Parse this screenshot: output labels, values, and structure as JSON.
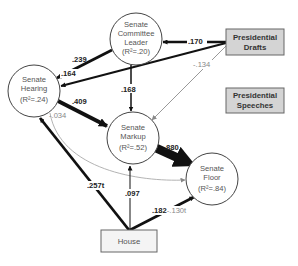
{
  "diagram": {
    "type": "path-model",
    "nodes": {
      "committee_leader": {
        "line1": "Senate",
        "line2": "Committee",
        "line3": "Leader",
        "r2": "(R²=.20)"
      },
      "hearing": {
        "line1": "Senate",
        "line2": "Hearing",
        "r2": "(R²=.24)"
      },
      "markup": {
        "line1": "Senate",
        "line2": "Markup",
        "r2": "(R²=.52)"
      },
      "floor": {
        "line1": "Senate",
        "line2": "Floor",
        "r2": "(R²=.84)"
      },
      "presidential_drafts": {
        "line1": "Presidential",
        "line2": "Drafts"
      },
      "presidential_speeches": {
        "line1": "Presidential",
        "line2": "Speeches"
      },
      "house": {
        "label": "House"
      }
    },
    "edges": [
      {
        "from": "Presidential Drafts",
        "to": "Senate Committee Leader",
        "label": ".170",
        "style": "thick"
      },
      {
        "from": "Presidential Drafts",
        "to": "Senate Hearing",
        "label": ".164",
        "style": "thick"
      },
      {
        "from": "Presidential Drafts",
        "to": "Senate Markup",
        "label": "-.134",
        "style": "thin-gray"
      },
      {
        "from": "Senate Committee Leader",
        "to": "Senate Hearing",
        "label": ".239",
        "style": "thick"
      },
      {
        "from": "Senate Committee Leader",
        "to": "Senate Markup",
        "label": ".168",
        "style": "medium"
      },
      {
        "from": "Senate Hearing",
        "to": "Senate Markup",
        "label": ".409",
        "style": "thicker"
      },
      {
        "from": "Senate Hearing",
        "to": "Senate Floor",
        "label": "-.034",
        "style": "thin-gray-curve"
      },
      {
        "from": "Senate Markup",
        "to": "Senate Floor",
        "label": ".880",
        "style": "thickest"
      },
      {
        "from": "House",
        "to": "Senate Hearing",
        "label": ".257t",
        "style": "thick"
      },
      {
        "from": "House",
        "to": "Senate Markup",
        "label": ".097",
        "style": "thin"
      },
      {
        "from": "House",
        "to": "Senate Floor",
        "label_main": ".182",
        "label_secondary": "-.130t",
        "style": "thick"
      }
    ],
    "colors": {
      "box_fill": "#d4d4d4",
      "box_border": "#666666",
      "edge_dark": "#111111",
      "edge_gray": "#999999",
      "circle_border": "#444444"
    }
  }
}
